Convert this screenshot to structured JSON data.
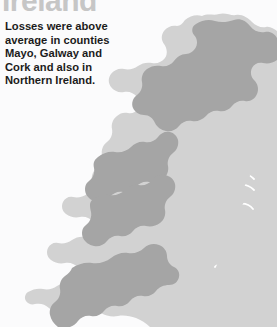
{
  "page": {
    "background_color": "#fbfbfc",
    "width": 277,
    "height": 327
  },
  "title": {
    "text": "Ireland",
    "color": "#c6c6c6",
    "cropped_at_top": true
  },
  "caption": {
    "full_text": "Losses were above average in counties Mayo, Galway and Cork and also in Northern Ireland.",
    "color": "#1b1b1b",
    "lines": [
      "Losses were above",
      "average in counties",
      "Mayo, Galway and",
      "Cork and also in",
      "Northern Ireland."
    ]
  },
  "map": {
    "name": "ireland-county-map",
    "base_fill": "#d2d2d2",
    "highlight_fill": "#a5a5a5",
    "border_color": "#ffffff",
    "highlighted_regions": [
      "Mayo",
      "Galway",
      "Cork",
      "Northern Ireland"
    ],
    "regions": [
      {
        "name": "northern-ireland",
        "highlighted": true
      },
      {
        "name": "mayo",
        "highlighted": true
      },
      {
        "name": "galway",
        "highlighted": true
      },
      {
        "name": "cork",
        "highlighted": true
      },
      {
        "name": "donegal",
        "highlighted": false
      },
      {
        "name": "sligo",
        "highlighted": false
      },
      {
        "name": "leitrim",
        "highlighted": false
      },
      {
        "name": "roscommon",
        "highlighted": false
      },
      {
        "name": "longford",
        "highlighted": false
      },
      {
        "name": "cavan",
        "highlighted": false
      },
      {
        "name": "monaghan",
        "highlighted": false
      },
      {
        "name": "louth",
        "highlighted": false
      },
      {
        "name": "meath",
        "highlighted": false
      },
      {
        "name": "westmeath",
        "highlighted": false
      },
      {
        "name": "dublin",
        "highlighted": false
      },
      {
        "name": "kildare",
        "highlighted": false
      },
      {
        "name": "offaly",
        "highlighted": false
      },
      {
        "name": "laois",
        "highlighted": false
      },
      {
        "name": "wicklow",
        "highlighted": false
      },
      {
        "name": "carlow",
        "highlighted": false
      },
      {
        "name": "kilkenny",
        "highlighted": false
      },
      {
        "name": "wexford",
        "highlighted": false
      },
      {
        "name": "waterford",
        "highlighted": false
      },
      {
        "name": "tipperary",
        "highlighted": false
      },
      {
        "name": "clare",
        "highlighted": false
      },
      {
        "name": "limerick",
        "highlighted": false
      },
      {
        "name": "kerry",
        "highlighted": false
      }
    ]
  }
}
